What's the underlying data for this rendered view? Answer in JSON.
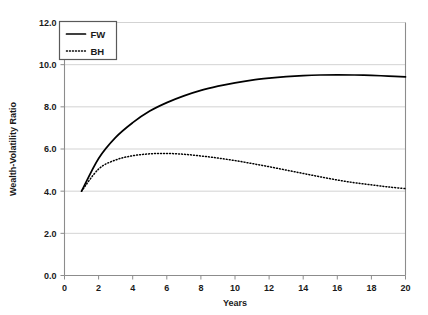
{
  "chart_data": {
    "type": "line",
    "title": "",
    "xlabel": "Years",
    "ylabel": "Wealth-Volatility Ratio",
    "xlim": [
      0,
      20
    ],
    "ylim": [
      0,
      12
    ],
    "grid": true,
    "legend_position": "top-left-inside",
    "xticks": [
      "0",
      "2",
      "4",
      "6",
      "8",
      "10",
      "12",
      "14",
      "16",
      "18",
      "20"
    ],
    "xtick_values": [
      0,
      2,
      4,
      6,
      8,
      10,
      12,
      14,
      16,
      18,
      20
    ],
    "yticks": [
      "0.0",
      "2.0",
      "4.0",
      "6.0",
      "8.0",
      "10.0",
      "12.0"
    ],
    "ytick_values": [
      0,
      2,
      4,
      6,
      8,
      10,
      12
    ],
    "x": [
      1,
      2,
      3,
      4,
      5,
      6,
      7,
      8,
      9,
      10,
      11,
      12,
      13,
      14,
      15,
      16,
      17,
      18,
      19,
      20
    ],
    "series": [
      {
        "name": "FW",
        "style": "solid",
        "color": "#000000",
        "values": [
          4.0,
          5.55,
          6.55,
          7.25,
          7.8,
          8.2,
          8.52,
          8.78,
          8.98,
          9.14,
          9.27,
          9.36,
          9.43,
          9.48,
          9.51,
          9.52,
          9.51,
          9.49,
          9.46,
          9.42
        ]
      },
      {
        "name": "BH",
        "style": "dotted",
        "color": "#000000",
        "values": [
          4.0,
          5.05,
          5.48,
          5.68,
          5.77,
          5.79,
          5.75,
          5.67,
          5.57,
          5.45,
          5.31,
          5.16,
          5.0,
          4.84,
          4.68,
          4.53,
          4.4,
          4.3,
          4.2,
          4.12
        ]
      }
    ],
    "legend": [
      {
        "label": "FW",
        "style": "solid"
      },
      {
        "label": "BH",
        "style": "dotted"
      }
    ],
    "colors": {
      "background": "#ffffff",
      "gridline": "#c8c8c8",
      "axis": "#8c8c8c",
      "text": "#1a1a1a",
      "series": "#000000"
    }
  }
}
